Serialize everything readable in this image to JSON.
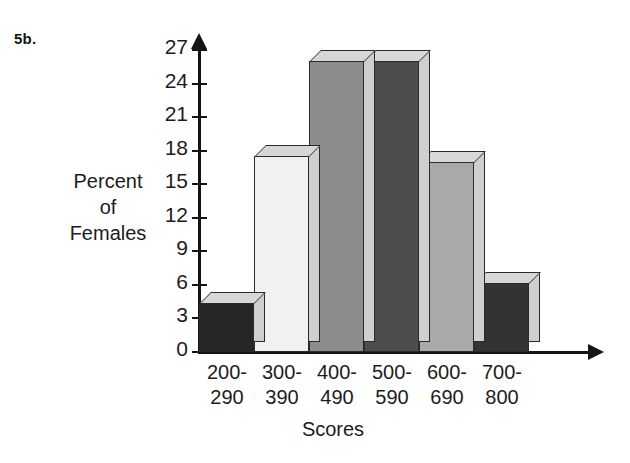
{
  "figure": {
    "problem_label": "5b.",
    "y_axis_title_lines": [
      "Percent",
      "of",
      "Females"
    ],
    "x_axis_title": "Scores"
  },
  "chart_data": {
    "type": "bar",
    "title": "",
    "subtitle": "",
    "xlabel": "Scores",
    "ylabel": "Percent of Females",
    "categories": [
      "200-290",
      "300-390",
      "400-490",
      "500-590",
      "600-690",
      "700-800"
    ],
    "category_lines": [
      [
        "200-",
        "290"
      ],
      [
        "300-",
        "390"
      ],
      [
        "400-",
        "490"
      ],
      [
        "500-",
        "590"
      ],
      [
        "600-",
        "690"
      ],
      [
        "700-",
        "800"
      ]
    ],
    "values": [
      4.4,
      17.5,
      26.0,
      26.0,
      17.0,
      6.2
    ],
    "bar_colors": [
      "#262626",
      "#f1f1f1",
      "#8c8c8c",
      "#4d4d4d",
      "#a9a9a9",
      "#333333"
    ],
    "ylim": [
      0,
      28.5
    ],
    "yticks": [
      0,
      3,
      6,
      9,
      12,
      15,
      18,
      21,
      24,
      27
    ],
    "ytick_labels": [
      "0",
      "3",
      "6",
      "9",
      "12",
      "15",
      "18",
      "21",
      "24",
      "27"
    ],
    "grid": false,
    "legend": "none",
    "style_3d": true
  }
}
